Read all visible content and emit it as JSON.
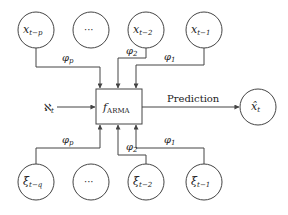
{
  "diagram": {
    "type": "ARMA model flow diagram",
    "center_node": {
      "symbol": "f",
      "subscript": "ARMA"
    },
    "exogenous_input": {
      "symbol": "ℵ",
      "subscript": "t"
    },
    "output": {
      "symbol": "x̂",
      "subscript": "t",
      "edge_label": "Prediction"
    },
    "ar_nodes": [
      {
        "symbol": "x",
        "subscript": "t−p"
      },
      {
        "symbol": "",
        "subscript": "",
        "ellipsis": "···"
      },
      {
        "symbol": "x",
        "subscript": "t−2"
      },
      {
        "symbol": "x",
        "subscript": "t−1"
      }
    ],
    "ma_nodes": [
      {
        "symbol": "ξ",
        "subscript": "t−q"
      },
      {
        "symbol": "",
        "subscript": "",
        "ellipsis": "···"
      },
      {
        "symbol": "ξ",
        "subscript": "t−2"
      },
      {
        "symbol": "ξ",
        "subscript": "t−1"
      }
    ],
    "ar_coefficients": [
      {
        "symbol": "φ",
        "subscript": "p"
      },
      {
        "symbol": "φ",
        "subscript": "2"
      },
      {
        "symbol": "φ",
        "subscript": "1"
      }
    ],
    "ma_coefficients": [
      {
        "symbol": "φ",
        "subscript": "p"
      },
      {
        "symbol": "φ",
        "subscript": "2"
      },
      {
        "symbol": "φ",
        "subscript": "1"
      }
    ],
    "colors": {
      "stroke": "#444444",
      "text": "#222222",
      "background": "#ffffff"
    }
  }
}
